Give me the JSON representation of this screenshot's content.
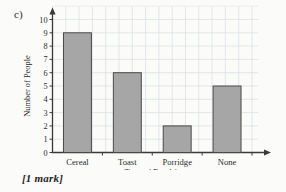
{
  "question": {
    "part_label": "c)",
    "mark_note": "[1 mark]"
  },
  "colors": {
    "paper": "#fbfbfa",
    "grid": "#d8dce2",
    "grid_major": "#c9ced6",
    "axis": "#3a3a3a",
    "bar_fill": "#a6a6a6",
    "bar_stroke": "#4a4a4a",
    "text": "#2b2b2b"
  },
  "chart_data": {
    "type": "bar",
    "title": "",
    "xlabel": "Type of Breakfast",
    "ylabel": "Number of People",
    "categories": [
      "Cereal",
      "Toast",
      "Porridge",
      "None"
    ],
    "values": [
      9,
      6,
      2,
      5
    ],
    "ylim": [
      0,
      10
    ],
    "ytick_labels": [
      "0",
      "1",
      "2",
      "3",
      "4",
      "5",
      "6",
      "7",
      "8",
      "9",
      "10"
    ],
    "ytick_values": [
      0,
      1,
      2,
      3,
      4,
      5,
      6,
      7,
      8,
      9,
      10
    ],
    "grid": true,
    "legend": "none",
    "axis_arrows": true
  }
}
